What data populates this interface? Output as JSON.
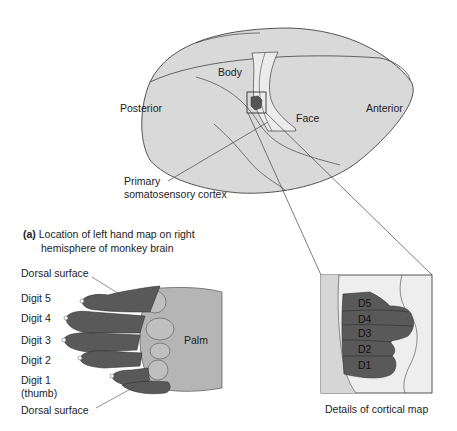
{
  "figure": {
    "panel_letter": "(a)",
    "caption_line1": "Location of left hand map on right",
    "caption_line2": "hemisphere of monkey brain",
    "detail_caption": "Details of cortical map"
  },
  "brain": {
    "labels": {
      "body": "Body",
      "face": "Face",
      "posterior": "Posterior",
      "anterior": "Anterior",
      "cortex_line1": "Primary",
      "cortex_line2": "somatosensory cortex"
    }
  },
  "hand": {
    "labels": {
      "dorsal_top": "Dorsal surface",
      "digit5": "Digit 5",
      "digit4": "Digit 4",
      "digit3": "Digit 3",
      "digit2": "Digit 2",
      "digit1": "Digit 1",
      "thumb": "(thumb)",
      "dorsal_bottom": "Dorsal surface",
      "palm": "Palm"
    }
  },
  "cortical_map": {
    "digits": [
      "D5",
      "D4",
      "D3",
      "D2",
      "D1"
    ]
  },
  "colors": {
    "brain_fill": "#d9d9d9",
    "strip_fill": "#ececec",
    "digit_fill": "#555555",
    "palm_fill": "#b5b5b5",
    "outline": "#333333"
  }
}
